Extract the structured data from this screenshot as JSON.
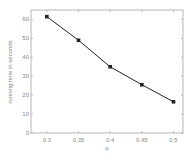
{
  "chart_data": {
    "type": "line",
    "title": "",
    "xlabel": "p",
    "ylabel": "running time in seconds",
    "x": [
      0.3,
      0.35,
      0.4,
      0.45,
      0.5
    ],
    "x_tick_labels": [
      "0.3",
      "0.35",
      "0.4",
      "0.45",
      "0.5"
    ],
    "series": [
      {
        "name": "running time",
        "values": [
          61.5,
          49,
          35,
          25.5,
          16.5
        ],
        "marker": "square",
        "color": "#222222"
      }
    ],
    "y_ticks": [
      0,
      10,
      20,
      30,
      40,
      50,
      60
    ],
    "y_tick_labels": [
      "0",
      "10",
      "20",
      "30",
      "40",
      "50",
      "60"
    ],
    "xlim": [
      0.275,
      0.515
    ],
    "ylim": [
      0,
      65
    ],
    "grid": false,
    "legend": null
  }
}
